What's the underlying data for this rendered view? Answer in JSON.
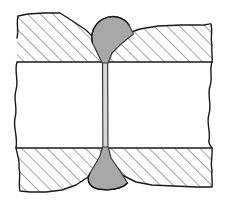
{
  "figure": {
    "canvas": {
      "width": 226,
      "height": 206
    },
    "colors": {
      "background": "#ffffff",
      "outline": "#1a1a1a",
      "hatch_line": "#2b2b2b",
      "weld_fill": "#a8a8a8",
      "weld_outline": "#3a3a3a",
      "seam_fill": "#d8d8d8",
      "plate_fill": "#ffffff"
    },
    "line_weights": {
      "outline": 1.4,
      "hatch": 0.85,
      "weld_outline": 1.2,
      "seam": 1.0
    },
    "hatching": {
      "angle_deg": 45,
      "direction": "lower-left-to-upper-right",
      "spacing_px": 9
    },
    "geometry": {
      "upper_plate": {
        "name": "upper-plate",
        "bottom_edge_y": 62,
        "top_edge_y": 14,
        "left_break_x": 16,
        "right_break_x": 212
      },
      "lower_plate": {
        "name": "lower-plate",
        "top_edge_y": 148,
        "bottom_edge_y": 193,
        "left_break_x": 16,
        "right_break_x": 212
      },
      "seam": {
        "name": "weld-seam",
        "center_x": 105,
        "left_x": 102.5,
        "right_x": 108.0,
        "top_y": 56,
        "bottom_y": 152
      },
      "crown_bead": {
        "name": "crown-bead",
        "apex_y": 17,
        "neck_y": 62,
        "half_width_px": 26
      },
      "root_bead": {
        "name": "root-bead",
        "neck_y": 148,
        "base_y": 188,
        "half_width_px": 24
      }
    },
    "parts": [
      {
        "id": "upper-left-plate",
        "label": "Upper left plate (sectioned)"
      },
      {
        "id": "upper-right-plate",
        "label": "Upper right plate (sectioned)"
      },
      {
        "id": "lower-left-plate",
        "label": "Lower left plate (sectioned)"
      },
      {
        "id": "lower-right-plate",
        "label": "Lower right plate (sectioned)"
      },
      {
        "id": "crown-bead",
        "label": "Crown weld bead"
      },
      {
        "id": "root-bead",
        "label": "Root weld bead"
      },
      {
        "id": "weld-seam",
        "label": "Narrow weld seam"
      },
      {
        "id": "left-break-line",
        "label": "Left freehand break line"
      },
      {
        "id": "right-break-line",
        "label": "Right freehand break line"
      }
    ]
  }
}
